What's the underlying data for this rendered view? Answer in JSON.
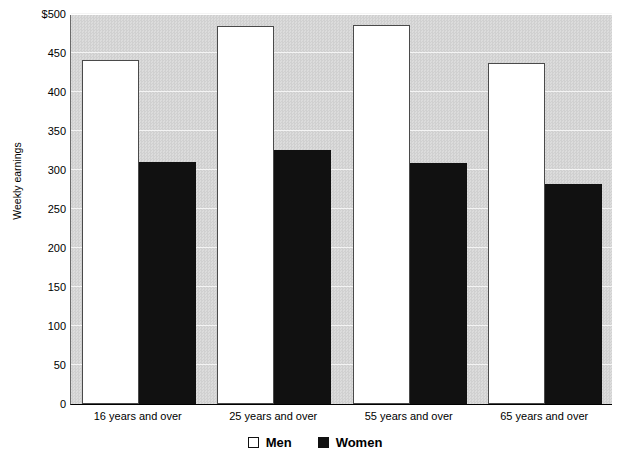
{
  "chart_data": {
    "type": "bar",
    "title": "",
    "xlabel": "",
    "ylabel": "Weekly earnings",
    "categories": [
      "16 years and over",
      "25 years and over",
      "55 years and over",
      "65 years and over"
    ],
    "series": [
      {
        "name": "Men",
        "values": [
          441,
          484,
          486,
          437
        ],
        "color": "#ffffff"
      },
      {
        "name": "Women",
        "values": [
          310,
          326,
          309,
          282
        ],
        "color": "#111111"
      }
    ],
    "ylim": [
      0,
      500
    ],
    "ytick_values": [
      500,
      450,
      400,
      350,
      300,
      250,
      200,
      150,
      100,
      50,
      0
    ],
    "ytick_labels": [
      "$500",
      "450",
      "400",
      "350",
      "300",
      "250",
      "200",
      "150",
      "100",
      "50",
      "0"
    ],
    "grid": true,
    "legend_position": "bottom"
  },
  "legend": {
    "items": [
      {
        "label": "Men",
        "swatch": "open-square-swatch"
      },
      {
        "label": "Women",
        "swatch": "filled-square-swatch"
      }
    ]
  },
  "title_sliver": {
    "text": ""
  }
}
